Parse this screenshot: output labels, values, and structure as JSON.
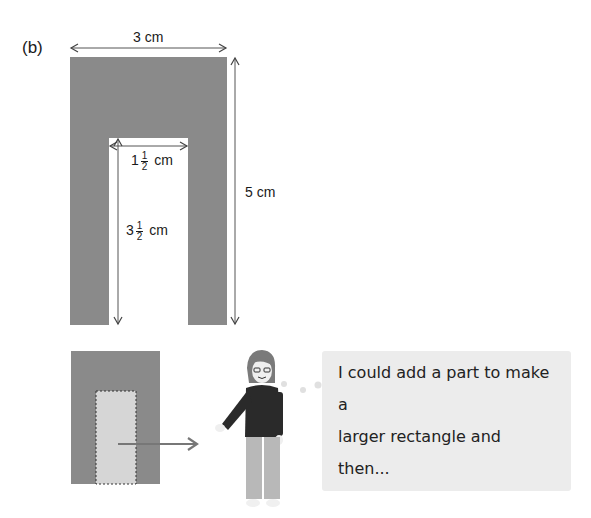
{
  "part_label": "(b)",
  "shape": {
    "fill_color": "#8a8a8a",
    "cutout_color": "#ffffff",
    "width_label": "3 cm",
    "height_label": "5 cm",
    "inner_width_label": {
      "whole": "1",
      "num": "1",
      "den": "2",
      "unit": "cm"
    },
    "inner_height_label": {
      "whole": "3",
      "num": "1",
      "den": "2",
      "unit": "cm"
    }
  },
  "hint": {
    "small_shape_fill": "#8a8a8a",
    "added_part_fill": "#d6d6d6",
    "arrow_color": "#777777"
  },
  "speech_bubble": {
    "line1": "I could add a part to make a",
    "line2": "larger rectangle and then...",
    "background": "#ececec"
  }
}
